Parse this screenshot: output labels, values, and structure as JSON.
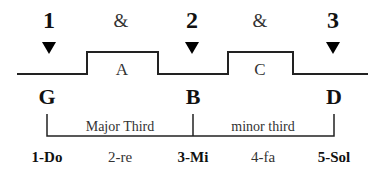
{
  "diagram": {
    "colors": {
      "line": "#222222",
      "marker": "#000000",
      "text": "#111111"
    },
    "beats": [
      {
        "label": "1",
        "x": 49
      },
      {
        "label": "2",
        "x": 192
      },
      {
        "label": "3",
        "x": 333
      }
    ],
    "offbeats": [
      {
        "label": "&",
        "x": 121
      },
      {
        "label": "&",
        "x": 260
      }
    ],
    "raised_blocks": [
      {
        "label": "A",
        "x_start": 87,
        "x_end": 158
      },
      {
        "label": "C",
        "x_start": 228,
        "x_end": 293
      }
    ],
    "waveform": {
      "x_start": 17,
      "x_end": 368,
      "y_low": 74,
      "y_high": 52
    },
    "notes": [
      {
        "label": "G",
        "x": 47
      },
      {
        "label": "B",
        "x": 193
      },
      {
        "label": "D",
        "x": 334
      }
    ],
    "intervals": [
      {
        "label": "Major Third",
        "x": 120
      },
      {
        "label": "minor third",
        "x": 263
      }
    ],
    "degrees": [
      {
        "label": "1-Do",
        "x": 47,
        "strong": true
      },
      {
        "label": "2-re",
        "x": 120,
        "strong": false
      },
      {
        "label": "3-Mi",
        "x": 193,
        "strong": true
      },
      {
        "label": "4-fa",
        "x": 263,
        "strong": false
      },
      {
        "label": "5-Sol",
        "x": 334,
        "strong": true
      }
    ]
  }
}
